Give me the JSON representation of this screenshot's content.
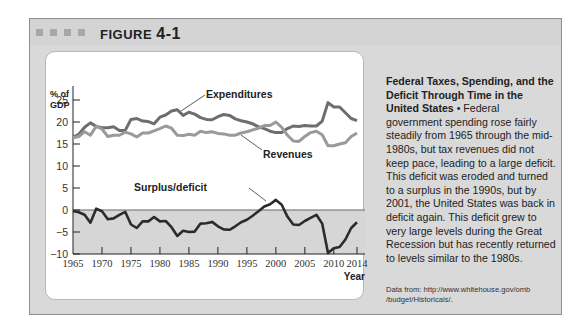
{
  "figure": {
    "label": "FIGURE",
    "number": "4-1"
  },
  "caption": {
    "title": "Federal Taxes, Spending, and the Deficit Through Time in the United States",
    "bullet": "•",
    "body": "Federal government spending rose fairly steadily from 1965 through the mid-1980s, but tax revenues did not keep pace, leading to a large deficit. This deficit was eroded and turned to a surplus in the 1990s, but by 2001, the United States was back in deficit again. This deficit grew to very large levels during the Great Recession but has recently returned to levels similar to the 1980s."
  },
  "source": {
    "line1": "Data from: http://www.whitehouse.gov/omb",
    "line2": "/budget/Historicals/."
  },
  "colors": {
    "frame": "#d9d9d9",
    "expenditures": "#6e6e6e",
    "revenues": "#9a9a9a",
    "deficit": "#2b2b2b",
    "deficit_fill": "#d6d6d6"
  },
  "chart_data": {
    "type": "line",
    "title": "",
    "ylabel": "% of GDP",
    "xlabel": "Year",
    "ylim": [
      -10,
      25
    ],
    "yticks": [
      -10,
      -5,
      0,
      5,
      10,
      15,
      20,
      25
    ],
    "xticks": [
      1965,
      1970,
      1975,
      1980,
      1985,
      1990,
      1995,
      2000,
      2005,
      2010,
      2014
    ],
    "grid": false,
    "annotations": [
      "Expenditures",
      "Revenues",
      "Surplus/deficit"
    ],
    "x": [
      1965,
      1966,
      1967,
      1968,
      1969,
      1970,
      1971,
      1972,
      1973,
      1974,
      1975,
      1976,
      1977,
      1978,
      1979,
      1980,
      1981,
      1982,
      1983,
      1984,
      1985,
      1986,
      1987,
      1988,
      1989,
      1990,
      1991,
      1992,
      1993,
      1994,
      1995,
      1996,
      1997,
      1998,
      1999,
      2000,
      2001,
      2002,
      2003,
      2004,
      2005,
      2006,
      2007,
      2008,
      2009,
      2010,
      2011,
      2012,
      2013,
      2014
    ],
    "series": [
      {
        "name": "Expenditures",
        "values": [
          16.6,
          17.2,
          18.8,
          19.8,
          19.0,
          18.7,
          18.7,
          18.9,
          18.1,
          18.1,
          20.6,
          20.8,
          20.2,
          20.1,
          19.6,
          21.1,
          21.6,
          22.5,
          22.8,
          21.5,
          22.2,
          21.8,
          21.0,
          20.6,
          20.5,
          21.2,
          21.7,
          21.5,
          20.7,
          20.3,
          20.0,
          19.6,
          18.9,
          18.5,
          17.9,
          17.6,
          17.6,
          18.5,
          19.1,
          19.0,
          19.2,
          19.1,
          19.1,
          20.2,
          24.4,
          23.4,
          23.4,
          22.1,
          20.8,
          20.3
        ]
      },
      {
        "name": "Revenues",
        "values": [
          16.4,
          16.7,
          17.8,
          17.0,
          19.0,
          18.4,
          16.7,
          17.0,
          17.0,
          17.7,
          17.3,
          16.6,
          17.5,
          17.5,
          18.0,
          18.5,
          19.1,
          18.6,
          17.0,
          16.9,
          17.2,
          17.0,
          17.9,
          17.6,
          17.8,
          17.4,
          17.3,
          17.0,
          17.0,
          17.5,
          17.8,
          18.2,
          18.6,
          19.2,
          19.2,
          20.0,
          18.8,
          17.0,
          15.7,
          15.6,
          16.7,
          17.6,
          17.9,
          17.1,
          14.6,
          14.6,
          15.0,
          15.3,
          16.7,
          17.5
        ]
      },
      {
        "name": "Surplus/deficit",
        "values": [
          -0.2,
          -0.5,
          -1.1,
          -2.9,
          0.3,
          -0.3,
          -2.1,
          -1.9,
          -1.1,
          -0.4,
          -3.3,
          -4.1,
          -2.6,
          -2.6,
          -1.6,
          -2.6,
          -2.5,
          -3.9,
          -5.9,
          -4.7,
          -5.0,
          -4.9,
          -3.1,
          -3.0,
          -2.7,
          -3.7,
          -4.4,
          -4.5,
          -3.7,
          -2.8,
          -2.2,
          -1.3,
          -0.3,
          0.8,
          1.3,
          2.3,
          1.2,
          -1.5,
          -3.3,
          -3.4,
          -2.5,
          -1.8,
          -1.1,
          -3.1,
          -9.8,
          -8.7,
          -8.4,
          -6.7,
          -4.1,
          -2.8
        ]
      }
    ]
  }
}
